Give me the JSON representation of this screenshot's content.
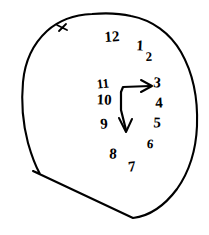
{
  "drawing": {
    "title": "Hand-drawn clock face",
    "type": "clock-drawing-test",
    "ink_color": "#000000",
    "background_color": "#ffffff",
    "canvas": {
      "width": 209,
      "height": 235
    },
    "dial": {
      "label": "hand-drawn clock outline",
      "shape": "irregular closed circle",
      "stroke_width": 2.1,
      "bounds": {
        "left": 22,
        "top": 14,
        "right": 198,
        "bottom": 222
      },
      "tick_mark": {
        "label": "stray tick mark on upper-left arc",
        "x": 62,
        "y": 27
      },
      "closure_note": "straight chord across lower left meeting outline at bottom"
    },
    "numerals": [
      {
        "label": "12",
        "x": 112,
        "y": 38,
        "size": "normal",
        "clock_position": 12
      },
      {
        "label": "1",
        "x": 140,
        "y": 47,
        "size": "normal",
        "clock_position": 1
      },
      {
        "label": "2",
        "x": 149,
        "y": 58,
        "size": "small",
        "clock_position": 2
      },
      {
        "label": "3",
        "x": 157,
        "y": 84,
        "size": "normal",
        "clock_position": 3
      },
      {
        "label": "4",
        "x": 159,
        "y": 104,
        "size": "normal",
        "clock_position": 4
      },
      {
        "label": "5",
        "x": 157,
        "y": 124,
        "size": "normal",
        "clock_position": 5
      },
      {
        "label": "6",
        "x": 150,
        "y": 145,
        "size": "small",
        "clock_position": 6
      },
      {
        "label": "7",
        "x": 132,
        "y": 168,
        "size": "normal",
        "clock_position": 7
      },
      {
        "label": "8",
        "x": 113,
        "y": 155,
        "size": "normal",
        "clock_position": 8
      },
      {
        "label": "9",
        "x": 104,
        "y": 125,
        "size": "normal",
        "clock_position": 9
      },
      {
        "label": "10",
        "x": 104,
        "y": 101,
        "size": "normal",
        "clock_position": 10
      },
      {
        "label": "11",
        "x": 103,
        "y": 85,
        "size": "small",
        "clock_position": 11
      }
    ],
    "hands": [
      {
        "name": "horizontal-hand",
        "label": "hand pointing right toward 3",
        "from": {
          "x": 122,
          "y": 93
        },
        "to": {
          "x": 150,
          "y": 87
        },
        "has_arrowhead": true,
        "stroke_width": 2.2
      },
      {
        "name": "vertical-hand",
        "label": "hand pointing down toward 6",
        "from": {
          "x": 122,
          "y": 93
        },
        "to": {
          "x": 127,
          "y": 132
        },
        "has_arrowhead": true,
        "stroke_width": 2.2
      }
    ]
  }
}
